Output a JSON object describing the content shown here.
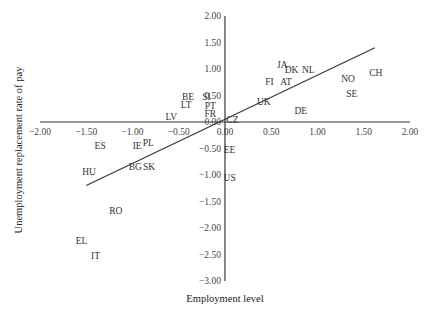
{
  "chart_data": {
    "type": "scatter",
    "title": "",
    "xlabel": "Employment level",
    "ylabel": "Unemployment replacement rate of pay",
    "xlim": [
      -2.0,
      2.0
    ],
    "ylim": [
      -3.0,
      2.0
    ],
    "grid": false,
    "legend": null,
    "x_ticks": [
      "-2.00",
      "-1.50",
      "-1.00",
      "-0.50",
      "0.00",
      "0.50",
      "1.00",
      "1.50",
      "2.00"
    ],
    "y_ticks": [
      "2.00",
      "1.50",
      "1.00",
      "0.50",
      "0.00",
      "-0.50",
      "-1.00",
      "-1.50",
      "-2.00",
      "-2.50",
      "-3.00"
    ],
    "points": [
      {
        "label": "JA",
        "x": 0.62,
        "y": 1.08
      },
      {
        "label": "DK",
        "x": 0.72,
        "y": 0.98
      },
      {
        "label": "NL",
        "x": 0.9,
        "y": 0.98
      },
      {
        "label": "FI",
        "x": 0.48,
        "y": 0.75
      },
      {
        "label": "AT",
        "x": 0.66,
        "y": 0.75
      },
      {
        "label": "NO",
        "x": 1.33,
        "y": 0.82
      },
      {
        "label": "CH",
        "x": 1.63,
        "y": 0.92
      },
      {
        "label": "SE",
        "x": 1.37,
        "y": 0.53
      },
      {
        "label": "UK",
        "x": 0.42,
        "y": 0.37
      },
      {
        "label": "DE",
        "x": 0.82,
        "y": 0.2
      },
      {
        "label": "BE",
        "x": -0.4,
        "y": 0.47
      },
      {
        "label": "SI",
        "x": -0.2,
        "y": 0.47
      },
      {
        "label": "LT",
        "x": -0.42,
        "y": 0.33
      },
      {
        "label": "PT",
        "x": -0.16,
        "y": 0.31
      },
      {
        "label": "FR",
        "x": -0.16,
        "y": 0.16
      },
      {
        "label": "LV",
        "x": -0.58,
        "y": 0.1
      },
      {
        "label": "CZ",
        "x": 0.08,
        "y": 0.03
      },
      {
        "label": "ES",
        "x": -1.35,
        "y": -0.45
      },
      {
        "label": "IE",
        "x": -0.95,
        "y": -0.45
      },
      {
        "label": "PL",
        "x": -0.83,
        "y": -0.4
      },
      {
        "label": "EE",
        "x": 0.05,
        "y": -0.52
      },
      {
        "label": "HU",
        "x": -1.47,
        "y": -0.95
      },
      {
        "label": "BG",
        "x": -0.97,
        "y": -0.85
      },
      {
        "label": "SK",
        "x": -0.82,
        "y": -0.85
      },
      {
        "label": "US",
        "x": 0.05,
        "y": -1.05
      },
      {
        "label": "RO",
        "x": -1.18,
        "y": -1.68
      },
      {
        "label": "EL",
        "x": -1.55,
        "y": -2.25
      },
      {
        "label": "IT",
        "x": -1.4,
        "y": -2.52
      }
    ],
    "trendline": {
      "x1": -1.5,
      "y1": -1.2,
      "x2": 1.62,
      "y2": 1.4
    }
  }
}
